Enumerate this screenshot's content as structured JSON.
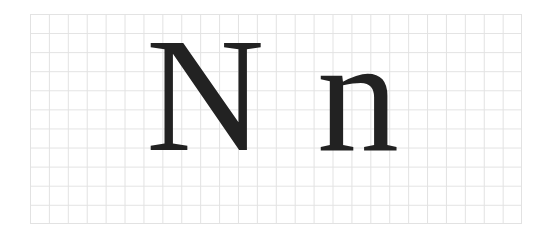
{
  "figure": {
    "uppercase_letter": "N",
    "lowercase_letter": "n",
    "grid": {
      "columns": 26,
      "rows": 11,
      "line_color": "#e2e2e2"
    },
    "glyph_color": "#222222"
  }
}
